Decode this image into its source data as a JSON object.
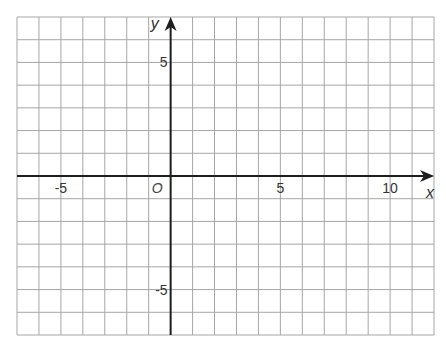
{
  "grid": {
    "x_min": -7,
    "x_max": 12,
    "y_min": -7,
    "y_max": 7,
    "left_px": 17,
    "right_px": 434,
    "top_px": 17,
    "bottom_px": 335,
    "grid_color": "#a6a6a6",
    "axis_color": "#1e1e1e",
    "label_color": "#333333"
  },
  "axes": {
    "x_label": "x",
    "y_label": "y",
    "origin_label": "O"
  },
  "tick_labels": {
    "x": [
      {
        "value": -5,
        "text": "-5"
      },
      {
        "value": 5,
        "text": "5"
      },
      {
        "value": 10,
        "text": "10"
      }
    ],
    "y": [
      {
        "value": 5,
        "text": "5"
      },
      {
        "value": -5,
        "text": "-5"
      }
    ]
  },
  "chart_data": {
    "type": "scatter",
    "title": "",
    "xlabel": "x",
    "ylabel": "y",
    "xlim": [
      -7,
      12
    ],
    "ylim": [
      -7,
      7
    ],
    "grid": true,
    "x_ticks_labeled": [
      -5,
      5,
      10
    ],
    "y_ticks_labeled": [
      5,
      -5
    ],
    "origin_label": "O",
    "series": []
  }
}
